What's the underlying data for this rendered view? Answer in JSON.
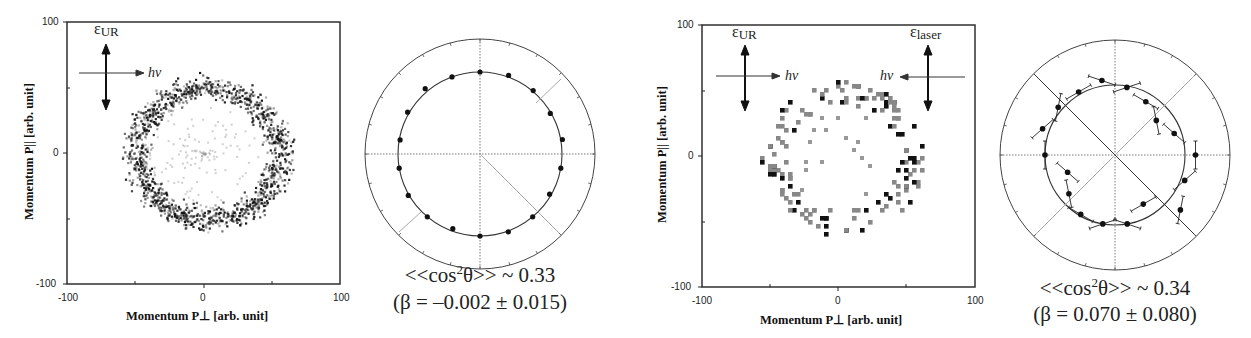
{
  "chart_data": [
    {
      "type": "heatmap",
      "panel": "left-momentum-image",
      "xlabel": "Momentum P⊥ [arb. unit]",
      "ylabel": "Momentum P|| [arb. unit]",
      "xlim": [
        -100,
        100
      ],
      "ylim": [
        -100,
        100
      ],
      "x_ticks": [
        "-100",
        "0",
        "100"
      ],
      "y_ticks": [
        "100",
        "0",
        "-100"
      ],
      "annotations": [
        "εUR",
        "hν"
      ],
      "description": "Ring-shaped momentum distribution, radius ~50 arb. units, centered near (3,0)",
      "ring": {
        "cx": 3,
        "cy": 0,
        "radius": 50
      }
    },
    {
      "type": "scatter",
      "panel": "left-polar",
      "polar": true,
      "points_deg": [
        0,
        20,
        40,
        60,
        80,
        100,
        120,
        140,
        160,
        180,
        200,
        220,
        240,
        260,
        280,
        300,
        320,
        340
      ],
      "points_r": [
        1.0,
        1.02,
        1.01,
        0.99,
        1.02,
        1.0,
        0.98,
        1.0,
        1.01,
        1.0,
        0.97,
        1.0,
        1.01,
        1.0,
        0.99,
        1.02,
        1.04,
        1.0
      ],
      "fit": "circle",
      "annotation": "<<cos²θ>> ~ 0.33",
      "beta": "β = –0.002 ± 0.015"
    },
    {
      "type": "heatmap",
      "panel": "right-momentum-image",
      "xlabel": "Momentum P⊥ [arb. unit]",
      "ylabel": "Momentum P|| [arb. unit]",
      "xlim": [
        -100,
        100
      ],
      "ylim": [
        -100,
        100
      ],
      "x_ticks": [
        "-100",
        "0",
        "100"
      ],
      "y_ticks": [
        "100",
        "0",
        "-100"
      ],
      "annotations": [
        "εUR",
        "hν",
        "εlaser",
        "hν"
      ],
      "description": "Sparse pixelated ring, radius ~50 arb. units",
      "ring": {
        "cx": 2,
        "cy": 0,
        "radius": 50
      }
    },
    {
      "type": "scatter",
      "panel": "right-polar",
      "polar": true,
      "error_bars": true,
      "points_deg": [
        10,
        30,
        50,
        70,
        90,
        110,
        130,
        150,
        170,
        190,
        210,
        230,
        250,
        270,
        290,
        310,
        330,
        350
      ],
      "points_r": [
        0.98,
        0.88,
        0.77,
        0.9,
        1.15,
        1.06,
        1.22,
        0.81,
        1.0,
        1.0,
        0.98,
        0.86,
        0.72,
        1.0,
        1.1,
        1.06,
        1.04,
        1.08
      ],
      "fit": "circle",
      "annotation": "<<cos²θ>> ~ 0.34",
      "beta": "β = 0.070 ± 0.080"
    }
  ],
  "panels": {
    "left_image": {
      "y_tick_top": "100",
      "y_tick_mid": "0",
      "y_tick_bot": "-100",
      "x_tick_left": "-100",
      "x_tick_mid": "0",
      "x_tick_right": "100",
      "xlabel": "Momentum P⊥ [arb. unit]",
      "ylabel": "Momentum P|| [arb. unit]",
      "eps_main": "ε",
      "eps_sub": "UR",
      "hv": "hν"
    },
    "left_polar": {
      "caption_line1_pre": "<<cos",
      "caption_line1_sup": "2",
      "caption_line1_post": "θ>> ~ 0.33",
      "caption_line2": "(β = –0.002 ± 0.015)"
    },
    "right_image": {
      "y_tick_top": "100",
      "y_tick_mid": "0",
      "y_tick_bot": "-100",
      "x_tick_left": "-100",
      "x_tick_mid": "0",
      "x_tick_right": "100",
      "xlabel": "Momentum P⊥ [arb. unit]",
      "ylabel": "Momentum P|| [arb. unit]",
      "eps_main": "ε",
      "eps_sub": "UR",
      "eps2_main": "ε",
      "eps2_sub": "laser",
      "hv": "hν",
      "hv2": "hν"
    },
    "right_polar": {
      "caption_line1_pre": "<<cos",
      "caption_line1_sup": "2",
      "caption_line1_post": "θ>> ~ 0.34",
      "caption_line2": "(β = 0.070 ± 0.080)"
    }
  }
}
